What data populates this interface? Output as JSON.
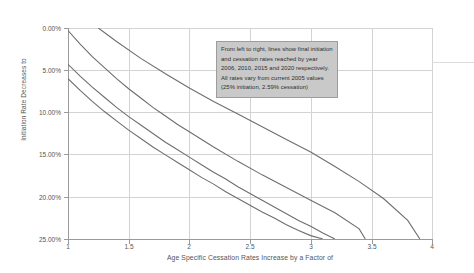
{
  "chart_data": {
    "type": "line",
    "title": "",
    "xlabel": "Age Specific Cessation Rates Increase by a Factor of",
    "ylabel": "Initiation Rate Decreases to",
    "xlim": [
      1,
      4
    ],
    "ylim": [
      0,
      25
    ],
    "y_inverted": true,
    "grid": true,
    "legend": "none",
    "xtick_labels": [
      "1",
      "1.5",
      "2",
      "2.5",
      "3",
      "3.5",
      "4"
    ],
    "xtick_values": [
      1,
      1.5,
      2,
      2.5,
      3,
      3.5,
      4
    ],
    "ytick_labels": [
      "0.00%",
      "5.00%",
      "10.00%",
      "15.00%",
      "20.00%",
      "25.00%"
    ],
    "ytick_values": [
      0,
      5,
      10,
      15,
      20,
      25
    ],
    "annotation": "From left to right, lines show final initiation and cessation rates reached by year 2006, 2010, 2015 and 2020 respectively. All rates vary from current 2005 values (25% initiation, 2.59% cessation)",
    "series": [
      {
        "name": "2020",
        "x": [
          1.0,
          1.1,
          1.2,
          1.3,
          1.4,
          1.5,
          1.6,
          1.7,
          1.8,
          1.9,
          2.0,
          2.1,
          2.2,
          2.3,
          2.4,
          2.5,
          2.6,
          2.7,
          2.8,
          2.9,
          3.0,
          3.1
        ],
        "values": [
          6.0,
          7.4,
          8.7,
          9.9,
          11.0,
          12.1,
          13.1,
          14.1,
          15.0,
          15.9,
          16.8,
          17.7,
          18.5,
          19.4,
          20.2,
          21.0,
          21.8,
          22.5,
          23.3,
          24.0,
          24.6,
          25.0
        ]
      },
      {
        "name": "2015",
        "x": [
          1.0,
          1.1,
          1.2,
          1.3,
          1.4,
          1.5,
          1.6,
          1.7,
          1.8,
          1.9,
          2.0,
          2.1,
          2.2,
          2.3,
          2.4,
          2.5,
          2.6,
          2.7,
          2.8,
          2.9,
          3.0,
          3.1,
          3.2
        ],
        "values": [
          4.3,
          5.7,
          7.0,
          8.2,
          9.4,
          10.5,
          11.5,
          12.5,
          13.5,
          14.4,
          15.3,
          16.2,
          17.1,
          17.9,
          18.8,
          19.6,
          20.4,
          21.2,
          22.0,
          22.8,
          23.5,
          24.3,
          25.0
        ]
      },
      {
        "name": "2010",
        "x": [
          1.0,
          1.1,
          1.2,
          1.3,
          1.4,
          1.5,
          1.6,
          1.7,
          1.8,
          1.9,
          2.0,
          2.2,
          2.4,
          2.6,
          2.8,
          3.0,
          3.2,
          3.4,
          3.45
        ],
        "values": [
          0.3,
          1.9,
          3.4,
          4.7,
          6.0,
          7.2,
          8.3,
          9.4,
          10.4,
          11.4,
          12.3,
          14.1,
          15.8,
          17.4,
          18.9,
          20.4,
          21.9,
          23.8,
          25.0
        ]
      },
      {
        "name": "2006",
        "x": [
          1.25,
          1.4,
          1.6,
          1.8,
          2.0,
          2.2,
          2.4,
          2.6,
          2.8,
          3.0,
          3.2,
          3.4,
          3.6,
          3.8,
          3.9
        ],
        "values": [
          0.0,
          1.6,
          3.6,
          5.4,
          7.1,
          8.7,
          10.2,
          11.7,
          13.2,
          14.7,
          16.4,
          18.2,
          20.2,
          22.8,
          25.0
        ]
      }
    ]
  },
  "axes": {
    "y_title": "Initiation Rate Decreases to",
    "x_title": "Age Specific Cessation Rates Increase by a Factor of"
  },
  "annotation_box": {
    "text": "From left to right, lines show final initiation and cessation rates reached by year 2006, 2010, 2015 and 2020 respectively. All rates vary from current 2005 values (25% initiation, 2.59% cessation)",
    "background": "#c9c9c9",
    "border": "#9d9d9d"
  },
  "colors": {
    "line": "#6e6e6e",
    "grid": "#d3d3d3",
    "axis": "#9a9a9a",
    "text": "#555555",
    "background": "#ffffff"
  },
  "ytick_positions_px": [
    28,
    70,
    112,
    154,
    197,
    239
  ],
  "xtick_positions_px": [
    68,
    129,
    189,
    250,
    311,
    372,
    432
  ]
}
